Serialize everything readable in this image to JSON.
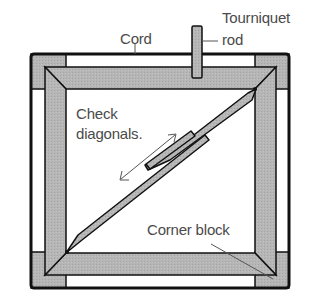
{
  "diagram": {
    "labels": {
      "tourniquet_line1": "Tourniquet",
      "tourniquet_line2": "rod",
      "cord": "Cord",
      "check_line1": "Check",
      "check_line2": "diagonals.",
      "corner_block": "Corner block"
    },
    "colors": {
      "frame_fill": "#b4b4b4",
      "outline": "#111111",
      "text": "#4a4a4a",
      "background": "#ffffff"
    },
    "parts": [
      "outer cord",
      "corner blocks",
      "mitered frame",
      "tourniquet rod",
      "diagonal measuring sticks",
      "double-headed arrow"
    ]
  }
}
